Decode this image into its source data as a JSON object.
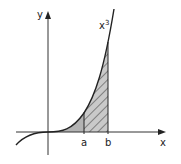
{
  "diagram": {
    "title": "",
    "curve_label": "x",
    "curve_exponent": "3",
    "x_axis_label": "x",
    "y_axis_label": "y",
    "bound_a_label": "a",
    "bound_b_label": "b",
    "colors": {
      "line": "#222222",
      "solid_fill": "#b3b3b3",
      "hatch_fill": "#c9c9c9"
    },
    "regions": [
      {
        "name": "solid-area",
        "from": "0",
        "to": "a",
        "style": "solid gray"
      },
      {
        "name": "hatched-area",
        "from": "a",
        "to": "b",
        "style": "diagonal hatch"
      }
    ]
  }
}
